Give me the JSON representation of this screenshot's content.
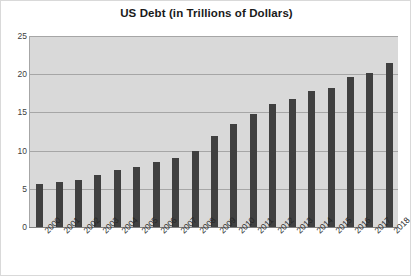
{
  "chart_data": {
    "type": "bar",
    "title": "US Debt (in Trillions of Dollars)",
    "xlabel": "",
    "ylabel": "",
    "ylim": [
      0,
      25
    ],
    "yticks": [
      "0",
      "5",
      "10",
      "15",
      "20",
      "25"
    ],
    "grid": true,
    "legend": null,
    "bar_color": "#404040",
    "plot_background": "#d9d9d9",
    "categories": [
      "2000",
      "2001",
      "2002",
      "2003",
      "2004",
      "2005",
      "2006",
      "2007",
      "2008",
      "2009",
      "2010",
      "2011",
      "2012",
      "2013",
      "2014",
      "2015",
      "2016",
      "2017",
      "2018"
    ],
    "values": [
      5.6,
      5.9,
      6.2,
      6.8,
      7.4,
      7.9,
      8.5,
      9.0,
      10.0,
      11.9,
      13.5,
      14.8,
      16.1,
      16.7,
      17.8,
      18.2,
      19.6,
      20.2,
      21.5
    ]
  },
  "bottom_caption": {
    "text": ""
  }
}
